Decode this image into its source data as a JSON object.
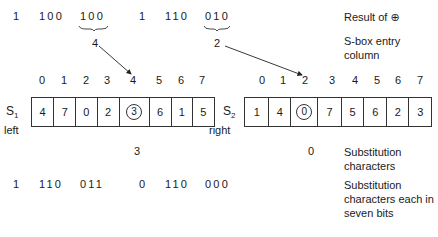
{
  "top_row": {
    "bits": [
      "1",
      "100",
      "100",
      "1",
      "110",
      "010"
    ],
    "braced_indices": [
      2,
      5
    ],
    "brace_values": [
      "4",
      "2"
    ]
  },
  "labels": {
    "result": "Result of ⊕",
    "entry_column": "S-box entry column",
    "substitution_chars": "Substitution characters",
    "substitution_bits": "Substitution characters each in seven bits"
  },
  "sboxes": [
    {
      "name": "S",
      "subscript": "1",
      "side": "left",
      "columns": [
        "0",
        "1",
        "2",
        "3",
        "4",
        "5",
        "6",
        "7"
      ],
      "values": [
        "4",
        "7",
        "0",
        "2",
        "3",
        "6",
        "1",
        "5"
      ],
      "selected_column": 4,
      "selected_value": "3"
    },
    {
      "name": "S",
      "subscript": "2",
      "side": "right",
      "columns": [
        "0",
        "1",
        "2",
        "3",
        "4",
        "5",
        "6",
        "7"
      ],
      "values": [
        "1",
        "4",
        "0",
        "7",
        "5",
        "6",
        "2",
        "3"
      ],
      "selected_column": 2,
      "selected_value": "0"
    }
  ],
  "substitution_row": [
    "3",
    "0"
  ],
  "bottom_row": {
    "bits": [
      "1",
      "110",
      "011",
      "0",
      "110",
      "000"
    ]
  }
}
